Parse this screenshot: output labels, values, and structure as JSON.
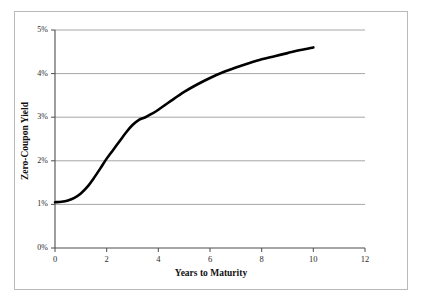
{
  "chart_data": {
    "type": "line",
    "title": "",
    "xlabel": "Years to Maturity",
    "ylabel": "Zero-Coupon Yield",
    "xlim": [
      0,
      12
    ],
    "ylim": [
      0,
      5
    ],
    "xticks": [
      "0",
      "2",
      "4",
      "6",
      "8",
      "10",
      "12"
    ],
    "xtick_values": [
      0,
      2,
      4,
      6,
      8,
      10,
      12
    ],
    "yticks": [
      "0%",
      "1%",
      "2%",
      "3%",
      "4%",
      "5%"
    ],
    "ytick_values": [
      0,
      1,
      2,
      3,
      4,
      5
    ],
    "grid": "horizontal",
    "legend": "none",
    "series": [
      {
        "name": "Zero-Coupon Yield Curve",
        "color": "#000000",
        "line_width": 2.6,
        "x": [
          0,
          0.25,
          0.5,
          0.75,
          1,
          1.25,
          1.5,
          1.75,
          2,
          2.25,
          2.5,
          2.75,
          3,
          3.25,
          3.5,
          3.75,
          4,
          4.5,
          5,
          5.5,
          6,
          6.5,
          7,
          7.5,
          8,
          8.5,
          9,
          9.5,
          10
        ],
        "y": [
          1.05,
          1.06,
          1.09,
          1.15,
          1.25,
          1.4,
          1.6,
          1.82,
          2.05,
          2.25,
          2.45,
          2.65,
          2.82,
          2.94,
          3.0,
          3.08,
          3.17,
          3.38,
          3.58,
          3.75,
          3.9,
          4.03,
          4.14,
          4.24,
          4.33,
          4.4,
          4.47,
          4.54,
          4.6
        ]
      }
    ],
    "axis_color": "#555555",
    "grid_color": "#aaaaaa",
    "frame_color": "#b9b9b9",
    "background": "#ffffff"
  }
}
